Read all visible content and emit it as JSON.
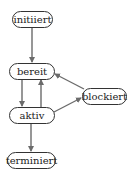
{
  "diagram": {
    "type": "state-diagram",
    "nodes": [
      {
        "id": "initiiert",
        "label": "initiiert"
      },
      {
        "id": "bereit",
        "label": "bereit"
      },
      {
        "id": "aktiv",
        "label": "aktiv"
      },
      {
        "id": "blockiert",
        "label": "blockiert"
      },
      {
        "id": "terminiert",
        "label": "terminiert"
      }
    ],
    "edges": [
      {
        "from": "initiiert",
        "to": "bereit"
      },
      {
        "from": "bereit",
        "to": "aktiv"
      },
      {
        "from": "aktiv",
        "to": "bereit"
      },
      {
        "from": "aktiv",
        "to": "blockiert"
      },
      {
        "from": "blockiert",
        "to": "bereit"
      },
      {
        "from": "aktiv",
        "to": "terminiert"
      }
    ],
    "colors": {
      "edge": "#6b6b6b",
      "node_border": "#333333",
      "text": "#222222"
    }
  }
}
